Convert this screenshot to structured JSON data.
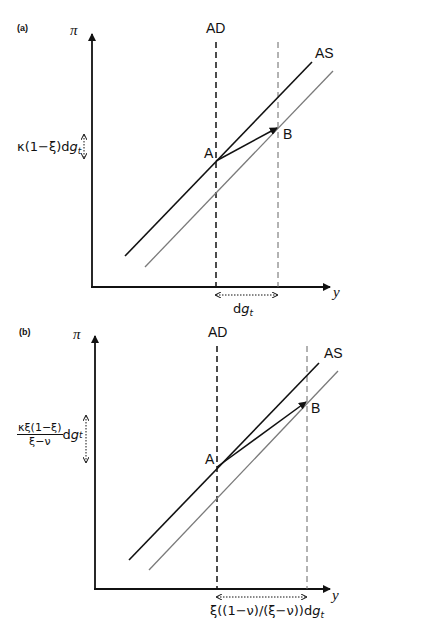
{
  "panels": [
    {
      "tag": "(a)",
      "y_axis_label": "π",
      "x_axis_label": "y",
      "ad_label": "AD",
      "as_label": "AS",
      "point_a": "A",
      "point_b": "B",
      "vertical_shift_label": {
        "prefix": "κ(1−ξ)d",
        "var": "g",
        "sub": "t"
      },
      "horizontal_shift_label": {
        "prefix": "d",
        "var": "g",
        "sub": "t"
      }
    },
    {
      "tag": "(b)",
      "y_axis_label": "π",
      "x_axis_label": "y",
      "ad_label": "AD",
      "as_label": "AS",
      "point_a": "A",
      "point_b": "B",
      "vertical_shift_label": {
        "numerator": "κξ(1−ξ)",
        "denominator": "ξ−ν",
        "suffix": "d",
        "var": "g",
        "sub": "t"
      },
      "horizontal_shift_label": {
        "prefix": "ξ((1−ν)/(ξ−ν))d",
        "var": "g",
        "sub": "t"
      }
    }
  ],
  "colors": {
    "axis": "#111111",
    "as_original": "#111111",
    "as_shifted": "#7a7a7a",
    "ad_original": "#111111",
    "ad_shifted": "#666666"
  }
}
